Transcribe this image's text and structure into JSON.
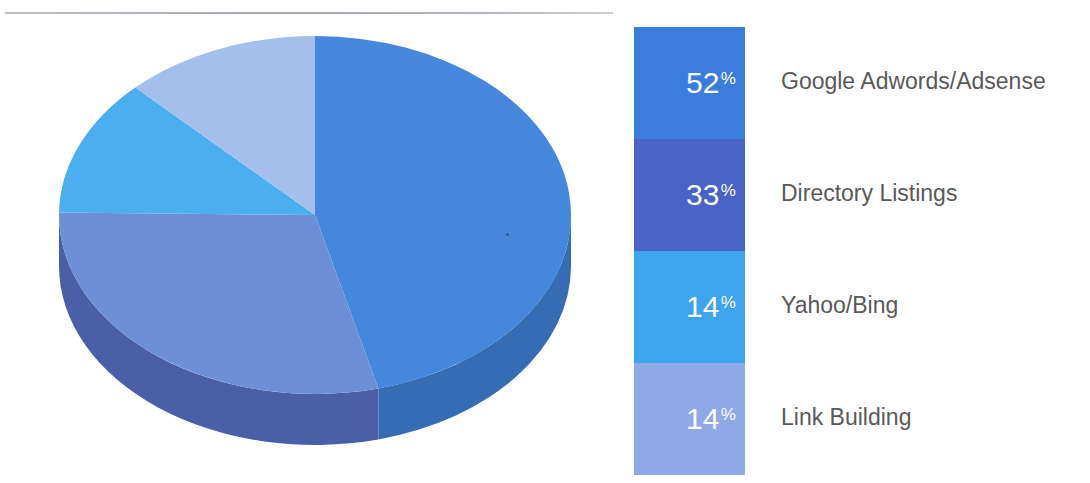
{
  "page": {
    "background": "#ffffff",
    "divider_color": "#a4a9b0"
  },
  "legend": {
    "items": [
      {
        "percent": "52",
        "percent_symbol": "%",
        "label": "Google Adwords/Adsense",
        "color": "#3B7DDD",
        "label_color": "#595959"
      },
      {
        "percent": "33",
        "percent_symbol": "%",
        "label": "Directory Listings",
        "color": "#4A63C6",
        "label_color": "#595959"
      },
      {
        "percent": "14",
        "percent_symbol": "%",
        "label": "Yahoo/Bing",
        "color": "#3FA4EE",
        "label_color": "#595959"
      },
      {
        "percent": "14",
        "percent_symbol": "%",
        "label": "Link Building",
        "color": "#8FA9E6",
        "label_color": "#595959"
      }
    ]
  },
  "chart_data": {
    "type": "pie",
    "title": "",
    "subtitle": "",
    "xlabel": "",
    "ylabel": "",
    "three_d": true,
    "start_angle_deg": 0,
    "direction": "clockwise",
    "legend_position": "right",
    "grid": false,
    "labels": [
      "Google Adwords/Adsense",
      "Directory Listings",
      "Yahoo/Bing",
      "Link Building"
    ],
    "values": [
      52,
      33,
      14,
      14
    ],
    "value_unit": "%",
    "total": 113,
    "colors": [
      "#4487DC",
      "#6C8FD8",
      "#4AAEEF",
      "#A4BFEB"
    ],
    "side_colors": [
      "#356CB4",
      "#4A5FA8",
      "#3B85BE",
      "#7E96CE"
    ],
    "slices": [
      {
        "label": "Google Adwords/Adsense",
        "value": 52,
        "display": "52%",
        "color": "#4487DC",
        "side_color": "#356CB4"
      },
      {
        "label": "Directory Listings",
        "value": 33,
        "display": "33%",
        "color": "#6C8FD8",
        "side_color": "#4A5FA8"
      },
      {
        "label": "Yahoo/Bing",
        "value": 14,
        "display": "14%",
        "color": "#4AAEEF",
        "side_color": "#3B85BE"
      },
      {
        "label": "Link Building",
        "value": 14,
        "display": "14%",
        "color": "#A4BFEB",
        "side_color": "#7E96CE"
      }
    ]
  }
}
